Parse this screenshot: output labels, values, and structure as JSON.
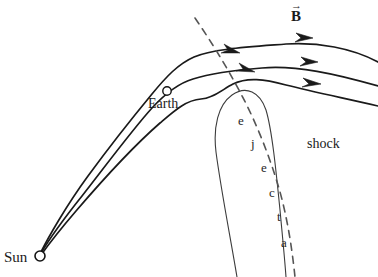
{
  "figure": {
    "type": "scientific-diagram",
    "width": 378,
    "height": 277,
    "background_color": "#ffffff",
    "line_color": "#1a1a1a",
    "ejecta_outline_color": "#3c3c3c",
    "shock_color": "#555555"
  },
  "labels": {
    "sun": "Sun",
    "earth": "Earth",
    "shock": "shock",
    "b_field": "B",
    "b_field_arrow": "→",
    "ejecta_letters": [
      "e",
      "j",
      "e",
      "c",
      "t",
      "a"
    ],
    "ejecta_word": "ejecta"
  },
  "markers": {
    "sun_circle": {
      "cx": 40,
      "cy": 256,
      "r": 5
    },
    "earth_circle": {
      "cx": 167,
      "cy": 91,
      "r": 4.2
    }
  },
  "field_lines": [
    {
      "name": "field-line-outer",
      "path": "M 41 252 C 48 238 66 206 88 176 C 110 146 133 117 152 94 C 166 77 178 64 194 57 C 212 49 248 47 286 44 C 318 42 352 48 378 62",
      "arrow": {
        "x": 307,
        "y": 37,
        "angle": 14
      }
    },
    {
      "name": "field-line-middle-earth",
      "path": "M 41 253 C 47 243 62 221 82 196 C 104 168 132 130 152 108 C 163 96 176 84 193 79 C 212 73 237 70 262 68 C 296 65 336 74 378 86",
      "arrow": {
        "x": 312,
        "y": 61,
        "angle": 16
      },
      "mid_arrow": {
        "x": 235,
        "y": 51,
        "angle": 20
      },
      "has_earth_marker": true
    },
    {
      "name": "field-line-inner",
      "path": "M 41 255 C 46 248 58 232 76 211 C 100 183 136 144 160 123 C 174 111 186 100 201 99 C 214 98 223 89 233 84 C 247 77 264 79 286 85 C 314 92 348 99 378 106",
      "arrow": {
        "x": 317,
        "y": 82,
        "angle": 14
      }
    }
  ],
  "ejecta_outline": {
    "name": "ejecta-boundary",
    "path": "M 237 277 C 230 235 221 190 216 152 C 213 127 218 105 232 95 C 246 85 260 92 266 110 C 272 130 276 170 280 210 C 283 242 285 262 286 277"
  },
  "shock_line": {
    "name": "shock-boundary",
    "path": "M 195 18 C 210 40 224 62 240 92 C 255 120 268 152 278 185 C 287 215 292 248 295 277",
    "dash": "7 6"
  },
  "accent_colors": {
    "ink": "#1a1a1a",
    "shock": "#555555",
    "ejecta": "#3c3c3c"
  }
}
